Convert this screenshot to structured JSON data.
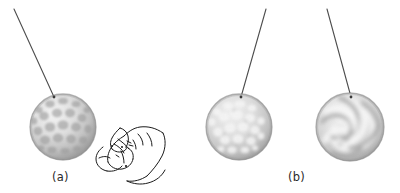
{
  "figure": {
    "width": 400,
    "height": 193,
    "background_color": "#ffffff"
  },
  "captions": [
    {
      "id": "caption-a",
      "text": "(a)",
      "x": 52,
      "y": 170
    },
    {
      "id": "caption-b",
      "text": "(b)",
      "x": 288,
      "y": 170
    }
  ],
  "colors": {
    "string": "#4d4d4d",
    "caption_text": "#2a2a2a",
    "hand_outline": "#1a1a1a",
    "ball_base_light": "#e8e8e8",
    "ball_base_mid": "#cfcfcf",
    "ball_shadow": "#8f8f8f",
    "ball_rim": "#7a7a7a",
    "dimple_dark": "#a8a8a8",
    "blotch_light": "#efefef",
    "swirl_light": "#f2f2f2",
    "swirl_dark": "#9d9d9d"
  },
  "strings": [
    {
      "name": "string-ball-1",
      "x1": 14,
      "y1": 9,
      "x2": 54,
      "y2": 97
    },
    {
      "name": "string-ball-2",
      "x1": 266,
      "y1": 9,
      "x2": 241,
      "y2": 97
    },
    {
      "name": "string-ball-3",
      "x1": 327,
      "y1": 9,
      "x2": 351,
      "y2": 97
    }
  ],
  "balls": [
    {
      "name": "ball-dimpled",
      "label": "dimpled golf-ball sphere",
      "cx": 63,
      "cy": 127,
      "r": 33,
      "pattern": "dimples"
    },
    {
      "name": "ball-blotched",
      "label": "light blotched sphere",
      "cx": 239,
      "cy": 127,
      "r": 33,
      "pattern": "blotches"
    },
    {
      "name": "ball-swirled",
      "label": "marbled swirl sphere",
      "cx": 350,
      "cy": 127,
      "r": 34,
      "pattern": "swirls"
    }
  ],
  "hand": {
    "name": "hand-plucking",
    "label": "line drawing of a hand pinching the string",
    "x": 95,
    "y": 122,
    "width": 72,
    "height": 62
  }
}
